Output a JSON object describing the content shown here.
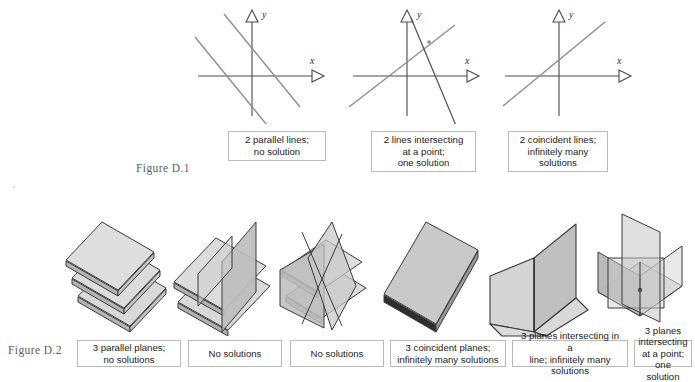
{
  "figure_labels": {
    "top": "Figure D.1",
    "bottom": "Figure D.2"
  },
  "axis_labels": {
    "x": "x",
    "y": "y"
  },
  "colors": {
    "axis": "#4a4a4a",
    "line": "#8d8d8d",
    "caption_border": "#b9b9b9",
    "plane_fill_light": "#dcdcdc",
    "plane_fill_mid": "#c8c8c8",
    "plane_fill_dark": "#b0b0b0",
    "plane_edge": "#3a3a3a",
    "text": "#1b1b1b"
  },
  "top_row": {
    "panels": [
      {
        "id": "parallel-lines",
        "caption": "2 parallel lines;\nno solution",
        "x_label": "x",
        "y_label": "y",
        "lines": [
          {
            "name": "line-1",
            "slope": -1.35,
            "intercept": 12
          },
          {
            "name": "line-2",
            "slope": -1.35,
            "intercept": -28
          }
        ]
      },
      {
        "id": "intersecting-lines",
        "caption": "2 lines intersecting\nat a point;\none solution",
        "x_label": "x",
        "y_label": "y",
        "lines": [
          {
            "name": "line-1",
            "slope": 0.72,
            "intercept": 14
          },
          {
            "name": "line-2",
            "slope": -2.6,
            "intercept": 40
          }
        ],
        "intersection_marked": true
      },
      {
        "id": "coincident-lines",
        "caption": "2 coincident lines;\ninfinitely many\nsolutions",
        "x_label": "x",
        "y_label": "y",
        "lines": [
          {
            "name": "line-1",
            "slope": 0.82,
            "intercept": 8
          }
        ]
      }
    ]
  },
  "bottom_row": {
    "panels": [
      {
        "id": "three-parallel-planes",
        "caption": "3 parallel planes;\nno solutions"
      },
      {
        "id": "two-parallel-one-crossing",
        "caption": "No solutions"
      },
      {
        "id": "two-parallel-one-vertical",
        "caption": "No solutions"
      },
      {
        "id": "three-coincident-planes",
        "caption": "3 coincident planes;\ninfinitely many solutions"
      },
      {
        "id": "three-planes-common-line",
        "caption": "3 planes intersecting in a\nline; infinitely many solutions"
      },
      {
        "id": "three-planes-common-point",
        "caption": "3 planes intersecting\nat a point; one solution"
      }
    ]
  }
}
